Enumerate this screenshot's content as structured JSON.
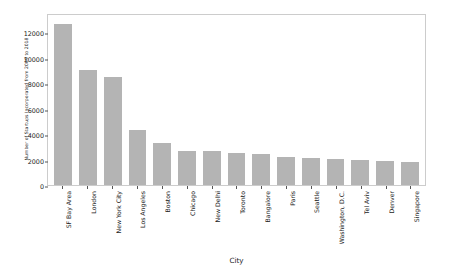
{
  "chart_data": {
    "type": "bar",
    "title": "",
    "xlabel": "City",
    "ylabel": "Number of Startups Incorporated from 2009 to 2018",
    "categories": [
      "SF Bay Area",
      "London",
      "New York City",
      "Los Angeles",
      "Boston",
      "Chicago",
      "New Delhi",
      "Toronto",
      "Bangalore",
      "Paris",
      "Seattle",
      "Washington, D.C.",
      "Tel Aviv",
      "Denver",
      "Singapore"
    ],
    "values": [
      12600,
      9050,
      8500,
      4300,
      3300,
      2700,
      2650,
      2550,
      2400,
      2200,
      2100,
      2050,
      1950,
      1850,
      1800
    ],
    "ylim": [
      0,
      13500
    ],
    "yticks": [
      0,
      2000,
      4000,
      6000,
      8000,
      10000,
      12000
    ],
    "ytick_labels": [
      "0",
      "2000",
      "4000",
      "6000",
      "8000",
      "10000",
      "12000"
    ],
    "grid": false,
    "legend": null,
    "bar_color": "#b4b4b4",
    "axes_color": "#cccccc",
    "text_color": "#1a1a1a"
  }
}
